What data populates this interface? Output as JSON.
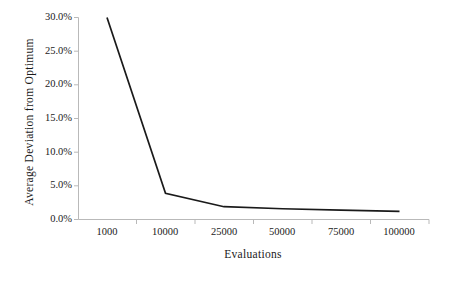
{
  "chart_data": {
    "type": "line",
    "title": "",
    "xlabel": "Evaluations",
    "ylabel": "Average Deviation from Optimum",
    "categories": [
      "1000",
      "10000",
      "25000",
      "50000",
      "75000",
      "100000"
    ],
    "x": [
      1000,
      10000,
      25000,
      50000,
      75000,
      100000
    ],
    "values": [
      30.0,
      3.9,
      1.9,
      1.6,
      1.4,
      1.2
    ],
    "value_labels": [
      "30.0%",
      "3.9%",
      "1.9%",
      "1.6%",
      "1.4%",
      "1.2%"
    ],
    "ylim": [
      0,
      30
    ],
    "yticks": [
      0,
      5,
      10,
      15,
      20,
      25,
      30
    ],
    "ytick_labels": [
      "0.0%",
      "5.0%",
      "10.0%",
      "15.0%",
      "20.0%",
      "25.0%",
      "30.0%"
    ],
    "xtick_labels": [
      "1000",
      "10000",
      "25000",
      "50000",
      "75000",
      "100000"
    ],
    "grid": false,
    "legend": false,
    "legend_position": "none",
    "series": [
      {
        "name": "Average Deviation from Optimum",
        "values": [
          30.0,
          3.9,
          1.9,
          1.6,
          1.4,
          1.2
        ]
      }
    ]
  },
  "style": {
    "line_color": "#1a1a1a",
    "axis_color": "#b9b9b9",
    "text_color": "#1a1a1a",
    "background": "#ffffff"
  },
  "axes": {
    "y_title": "Average Deviation from Optimum",
    "x_title": "Evaluations"
  }
}
